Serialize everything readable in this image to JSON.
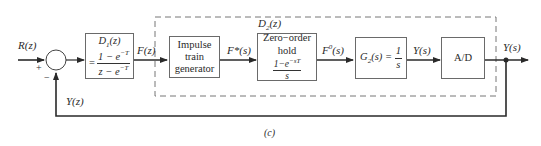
{
  "diagram": {
    "caption": "(c)",
    "input_label": "R(z)",
    "summing_junction": {
      "plus_sign": "+",
      "minus_sign": "−"
    },
    "feedback_label": "Y(z)",
    "group_label": "D2(z)",
    "blocks": [
      {
        "id": "d1",
        "title": "D1(z)",
        "eq_prefix": "=",
        "numerator": "1 − e^−T",
        "denominator": "z − e^−T"
      },
      {
        "id": "impulse",
        "lines": [
          "Impulse",
          "train",
          "generator"
        ]
      },
      {
        "id": "zoh",
        "lines": [
          "Zero−order",
          "hold"
        ],
        "numerator": "1−e^−sT",
        "denominator": "s"
      },
      {
        "id": "g2",
        "label": "G2(s) = ",
        "numerator": "1",
        "denominator": "s"
      },
      {
        "id": "ad",
        "label": "A/D"
      }
    ],
    "signals": {
      "after_d1": "F(z)",
      "after_impulse": "F*(s)",
      "after_zoh": "F0(s)",
      "after_g2": "Y(s)",
      "output": "Y(s)"
    },
    "colors": {
      "line": "#2a2a2a",
      "box_border": "#6a6a6a",
      "dashed": "#777777",
      "background": "#ffffff"
    }
  }
}
